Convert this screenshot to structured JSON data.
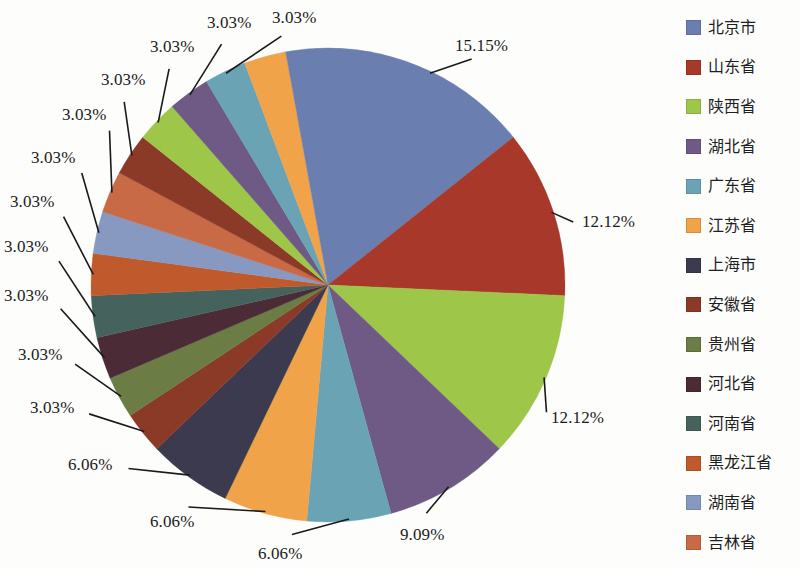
{
  "chart_data": {
    "type": "pie",
    "title": "",
    "subtitle": "",
    "xlabel": "",
    "ylabel": "",
    "legend_position": "right",
    "grid": false,
    "units": "%",
    "value_labels_format": "0.00%",
    "total": "100%",
    "categories": [
      "北京市",
      "山东省",
      "陕西省",
      "湖北省",
      "广东省",
      "江苏省",
      "上海市",
      "安徽省",
      "贵州省",
      "河北省",
      "河南省",
      "黑龙江省",
      "湖南省",
      "吉林省"
    ],
    "legend": [
      {
        "label": "北京市",
        "color": "#6a7fb0"
      },
      {
        "label": "山东省",
        "color": "#a8392a"
      },
      {
        "label": "陕西省",
        "color": "#9ec74a"
      },
      {
        "label": "湖北省",
        "color": "#6e5a85"
      },
      {
        "label": "广东省",
        "color": "#6aa3b4"
      },
      {
        "label": "江苏省",
        "color": "#f0a349"
      },
      {
        "label": "上海市",
        "color": "#3b3a4e"
      },
      {
        "label": "安徽省",
        "color": "#8c3a28"
      },
      {
        "label": "贵州省",
        "color": "#6c7c45"
      },
      {
        "label": "河北省",
        "color": "#4b2b36"
      },
      {
        "label": "河南省",
        "color": "#46625c"
      },
      {
        "label": "黑龙江省",
        "color": "#c05a2c"
      },
      {
        "label": "湖南省",
        "color": "#8799c0"
      },
      {
        "label": "吉林省",
        "color": "#c86a46"
      }
    ],
    "slices": [
      {
        "name": "北京市",
        "value": 15.15,
        "label": "15.15%",
        "color": "#6a7fb0"
      },
      {
        "name": "山东省",
        "value": 12.12,
        "label": "12.12%",
        "color": "#a8392a"
      },
      {
        "name": "陕西省",
        "value": 12.12,
        "label": "12.12%",
        "color": "#9ec74a"
      },
      {
        "name": "湖北省",
        "value": 9.09,
        "label": "9.09%",
        "color": "#6e5a85"
      },
      {
        "name": "广东省",
        "value": 6.06,
        "label": "6.06%",
        "color": "#6aa3b4"
      },
      {
        "name": "江苏省",
        "value": 6.06,
        "label": "6.06%",
        "color": "#f0a349"
      },
      {
        "name": "上海市",
        "value": 6.06,
        "label": "6.06%",
        "color": "#3b3a4e"
      },
      {
        "name": "安徽省",
        "value": 3.03,
        "label": "3.03%",
        "color": "#8c3a28"
      },
      {
        "name": "贵州省",
        "value": 3.03,
        "label": "3.03%",
        "color": "#6c7c45"
      },
      {
        "name": "河北省",
        "value": 3.03,
        "label": "3.03%",
        "color": "#4b2b36"
      },
      {
        "name": "河南省",
        "value": 3.03,
        "label": "3.03%",
        "color": "#46625c"
      },
      {
        "name": "黑龙江省",
        "value": 3.03,
        "label": "3.03%",
        "color": "#c05a2c"
      },
      {
        "name": "湖南省",
        "value": 3.03,
        "label": "3.03%",
        "color": "#8799c0"
      },
      {
        "name": "吉林省",
        "value": 3.03,
        "label": "3.03%",
        "color": "#c86a46"
      },
      {
        "name": "北京市",
        "value": 3.03,
        "label": "3.03%",
        "color": "#8c3a28"
      },
      {
        "name": "山东省",
        "value": 3.03,
        "label": "3.03%",
        "color": "#9ec74a"
      },
      {
        "name": "陕西省",
        "value": 3.03,
        "label": "3.03%",
        "color": "#6e5a85"
      },
      {
        "name": "湖北省",
        "value": 3.03,
        "label": "3.03%",
        "color": "#6aa3b4"
      },
      {
        "name": "广东省",
        "value": 3.03,
        "label": "3.03%",
        "color": "#f0a349"
      },
      {
        "name": "江苏省",
        "value": 3.03,
        "label": "3.03%",
        "color": "#6a7fb0"
      }
    ]
  },
  "geometry": {
    "center_x": 328,
    "center_y": 285,
    "radius": 237
  },
  "labels": [
    {
      "text": "15.15%",
      "x": 455,
      "y": 36,
      "anchor": "start"
    },
    {
      "text": "12.12%",
      "x": 582,
      "y": 212,
      "anchor": "start"
    },
    {
      "text": "12.12%",
      "x": 551,
      "y": 408,
      "anchor": "start"
    },
    {
      "text": "9.09%",
      "x": 400,
      "y": 525,
      "anchor": "start"
    },
    {
      "text": "6.06%",
      "x": 258,
      "y": 544,
      "anchor": "start"
    },
    {
      "text": "6.06%",
      "x": 150,
      "y": 512,
      "anchor": "start"
    },
    {
      "text": "6.06%",
      "x": 68,
      "y": 455,
      "anchor": "start"
    },
    {
      "text": "3.03%",
      "x": 30,
      "y": 398,
      "anchor": "start"
    },
    {
      "text": "3.03%",
      "x": 18,
      "y": 345,
      "anchor": "start"
    },
    {
      "text": "3.03%",
      "x": 4,
      "y": 286,
      "anchor": "start"
    },
    {
      "text": "3.03%",
      "x": 4,
      "y": 237,
      "anchor": "start"
    },
    {
      "text": "3.03%",
      "x": 10,
      "y": 192,
      "anchor": "start"
    },
    {
      "text": "3.03%",
      "x": 31,
      "y": 148,
      "anchor": "start"
    },
    {
      "text": "3.03%",
      "x": 62,
      "y": 105,
      "anchor": "start"
    },
    {
      "text": "3.03%",
      "x": 101,
      "y": 70,
      "anchor": "start"
    },
    {
      "text": "3.03%",
      "x": 150,
      "y": 37,
      "anchor": "start"
    },
    {
      "text": "3.03%",
      "x": 207,
      "y": 13,
      "anchor": "start"
    },
    {
      "text": "3.03%",
      "x": 272,
      "y": 8,
      "anchor": "start"
    }
  ]
}
